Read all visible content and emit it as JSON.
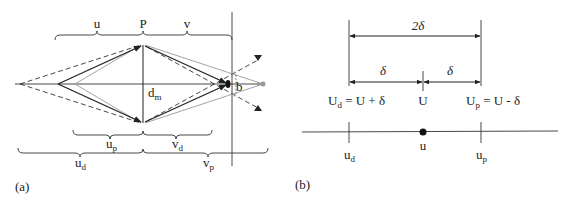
{
  "panel_a": {
    "tag": "(a)",
    "labels": {
      "u": "u",
      "P": "P",
      "v": "v",
      "dm_main": "d",
      "dm_sub": "m",
      "b": "b",
      "up_main": "u",
      "up_sub": "p",
      "vd_main": "v",
      "vd_sub": "d",
      "ud_main": "u",
      "ud_sub": "d",
      "vp_main": "v",
      "vp_sub": "p"
    },
    "colors": {
      "solid": "#222222",
      "dashed": "#333333",
      "gray": "#9a9a9a"
    }
  },
  "panel_b": {
    "tag": "(b)",
    "labels": {
      "two_delta": "2δ",
      "delta_left": "δ",
      "delta_right": "δ",
      "Ud_main": "U",
      "Ud_sub": "d",
      "Ud_expr": " = U + δ",
      "U": "U",
      "Up_main": "U",
      "Up_sub": "p",
      "Up_expr": " = U - δ",
      "u": "u",
      "ud_main": "u",
      "ud_sub": "d",
      "up_main": "u",
      "up_sub": "p"
    }
  }
}
